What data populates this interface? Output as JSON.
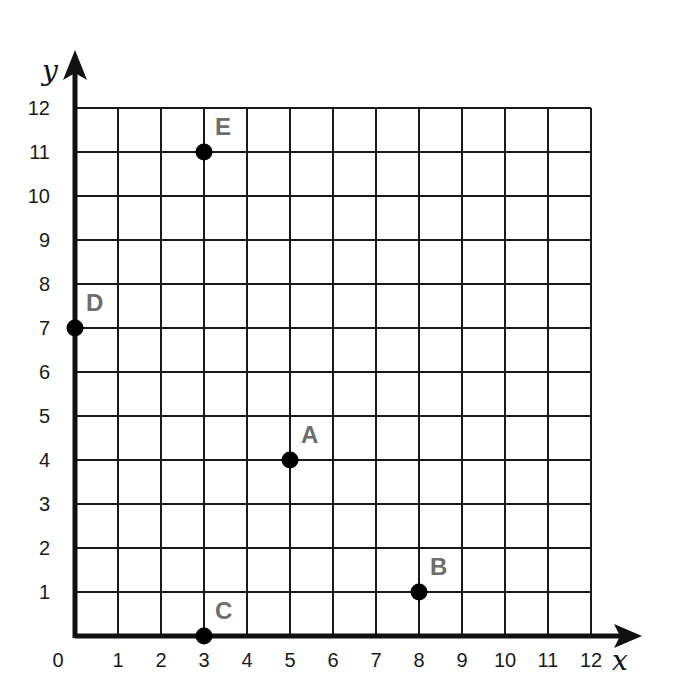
{
  "chart_data": {
    "type": "scatter",
    "title": "",
    "xlabel": "x",
    "ylabel": "y",
    "xlim": [
      0,
      12
    ],
    "ylim": [
      0,
      12
    ],
    "grid": true,
    "x_ticks": [
      "0",
      "1",
      "2",
      "3",
      "4",
      "5",
      "6",
      "7",
      "8",
      "9",
      "10",
      "11",
      "12"
    ],
    "y_ticks": [
      "1",
      "2",
      "3",
      "4",
      "5",
      "6",
      "7",
      "8",
      "9",
      "10",
      "11",
      "12"
    ],
    "points": [
      {
        "label": "A",
        "x": 5,
        "y": 4
      },
      {
        "label": "B",
        "x": 8,
        "y": 1
      },
      {
        "label": "C",
        "x": 3,
        "y": 0
      },
      {
        "label": "D",
        "x": 0,
        "y": 7
      },
      {
        "label": "E",
        "x": 3,
        "y": 11
      }
    ]
  },
  "colors": {
    "grid": "#1a1a1a",
    "axis": "#111111",
    "point": "#000000",
    "point_label": "#6d6d6d"
  }
}
